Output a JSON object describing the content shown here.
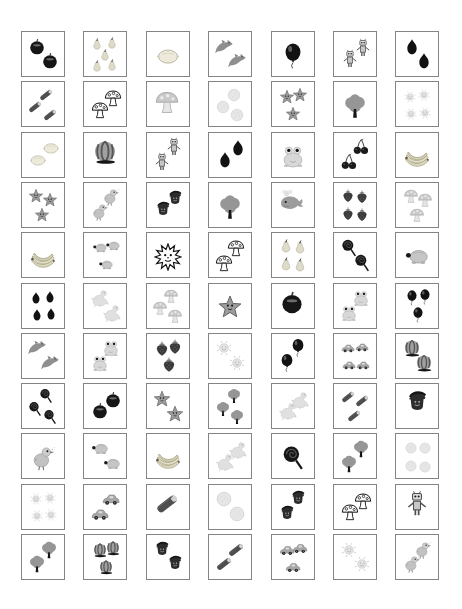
{
  "page": {
    "kind": "picture-counting-worksheet",
    "background": "#ffffff",
    "cell_border_color": "#848484",
    "ink_dark": "#141414",
    "ink_mid": "#9a9a9a",
    "ink_light": "#dcdcdc"
  },
  "grid": {
    "columns": 7,
    "row_count": 11,
    "rows": [
      {
        "cells": [
          {
            "item": "apple",
            "count": 2
          },
          {
            "item": "pear",
            "count": 5
          },
          {
            "item": "lemon",
            "count": 1
          },
          {
            "item": "dolphin",
            "count": 2
          },
          {
            "item": "balloon",
            "count": 1
          },
          {
            "item": "robot",
            "count": 2
          },
          {
            "item": "plum",
            "count": 2
          }
        ]
      },
      {
        "cells": [
          {
            "item": "zucchini",
            "count": 3
          },
          {
            "item": "mushroom-outline",
            "count": 2
          },
          {
            "item": "mushroom",
            "count": 1
          },
          {
            "item": "orange",
            "count": 3
          },
          {
            "item": "star",
            "count": 3
          },
          {
            "item": "tree",
            "count": 1
          },
          {
            "item": "sun",
            "count": 4
          }
        ]
      },
      {
        "cells": [
          {
            "item": "lemon",
            "count": 2
          },
          {
            "item": "watermelon",
            "count": 1
          },
          {
            "item": "robot",
            "count": 2
          },
          {
            "item": "plum",
            "count": 2
          },
          {
            "item": "frog",
            "count": 1
          },
          {
            "item": "cherry",
            "count": 2
          },
          {
            "item": "banana",
            "count": 1
          }
        ]
      },
      {
        "cells": [
          {
            "item": "star",
            "count": 3
          },
          {
            "item": "bird",
            "count": 2
          },
          {
            "item": "gnome",
            "count": 2
          },
          {
            "item": "tree",
            "count": 1
          },
          {
            "item": "whale",
            "count": 1
          },
          {
            "item": "strawberry",
            "count": 4
          },
          {
            "item": "mushroom",
            "count": 3
          }
        ]
      },
      {
        "cells": [
          {
            "item": "banana",
            "count": 1
          },
          {
            "item": "turtle",
            "count": 3
          },
          {
            "item": "sunburst",
            "count": 1
          },
          {
            "item": "mushroom-outline",
            "count": 2
          },
          {
            "item": "pear",
            "count": 4
          },
          {
            "item": "lollipop",
            "count": 2
          },
          {
            "item": "turtle",
            "count": 1
          }
        ]
      },
      {
        "cells": [
          {
            "item": "plum",
            "count": 4
          },
          {
            "item": "dino",
            "count": 2
          },
          {
            "item": "mushroom",
            "count": 3
          },
          {
            "item": "star",
            "count": 1
          },
          {
            "item": "apple",
            "count": 1
          },
          {
            "item": "frog",
            "count": 2
          },
          {
            "item": "balloon",
            "count": 3
          }
        ]
      },
      {
        "cells": [
          {
            "item": "dolphin",
            "count": 2
          },
          {
            "item": "frog",
            "count": 2
          },
          {
            "item": "strawberry",
            "count": 3
          },
          {
            "item": "sun",
            "count": 2
          },
          {
            "item": "balloon",
            "count": 2
          },
          {
            "item": "car",
            "count": 4
          },
          {
            "item": "watermelon",
            "count": 2
          }
        ]
      },
      {
        "cells": [
          {
            "item": "lollipop",
            "count": 3
          },
          {
            "item": "apple",
            "count": 2
          },
          {
            "item": "star",
            "count": 2
          },
          {
            "item": "tree",
            "count": 3
          },
          {
            "item": "dino",
            "count": 2
          },
          {
            "item": "zucchini",
            "count": 3
          },
          {
            "item": "gnome",
            "count": 1
          }
        ]
      },
      {
        "cells": [
          {
            "item": "bird",
            "count": 1
          },
          {
            "item": "turtle",
            "count": 2
          },
          {
            "item": "banana",
            "count": 1
          },
          {
            "item": "dino",
            "count": 2
          },
          {
            "item": "lollipop",
            "count": 1
          },
          {
            "item": "tree",
            "count": 2
          },
          {
            "item": "orange",
            "count": 4
          }
        ]
      },
      {
        "cells": [
          {
            "item": "sun",
            "count": 4
          },
          {
            "item": "car",
            "count": 2
          },
          {
            "item": "zucchini",
            "count": 1
          },
          {
            "item": "orange",
            "count": 2
          },
          {
            "item": "gnome",
            "count": 2
          },
          {
            "item": "mushroom-outline",
            "count": 2
          },
          {
            "item": "robot",
            "count": 1
          }
        ]
      },
      {
        "cells": [
          {
            "item": "tree",
            "count": 2
          },
          {
            "item": "watermelon",
            "count": 3
          },
          {
            "item": "gnome",
            "count": 2
          },
          {
            "item": "zucchini",
            "count": 2
          },
          {
            "item": "car",
            "count": 3
          },
          {
            "item": "sun",
            "count": 2
          },
          {
            "item": "bird",
            "count": 2
          }
        ]
      }
    ]
  },
  "icon_legend": {
    "apple": "apple-icon",
    "pear": "pear-icon",
    "plum": "plum-icon",
    "lemon": "lemon-icon",
    "dolphin": "dolphin-icon",
    "balloon": "balloon-icon",
    "robot": "robot-icon",
    "zucchini": "zucchini-icon",
    "mushroom-outline": "mushroom-outline-icon",
    "mushroom": "mushroom-icon",
    "orange": "orange-icon",
    "star": "star-face-icon",
    "tree": "tree-icon",
    "sun": "sun-face-icon",
    "sunburst": "sunburst-face-icon",
    "watermelon": "watermelon-icon",
    "frog": "frog-icon",
    "cherry": "cherries-icon",
    "banana": "banana-bunch-icon",
    "bird": "bird-icon",
    "gnome": "gnome-icon",
    "whale": "whale-icon",
    "strawberry": "strawberry-icon",
    "turtle": "turtle-icon",
    "dino": "dinosaur-icon",
    "lollipop": "lollipop-icon",
    "car": "car-icon"
  }
}
